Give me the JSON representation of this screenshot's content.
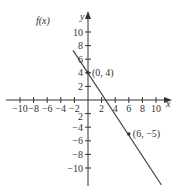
{
  "chart_data": {
    "type": "line",
    "title": "",
    "xlabel": "x",
    "ylabel": "y",
    "xlim": [
      -11,
      11
    ],
    "ylim": [
      -11,
      11
    ],
    "grid": false,
    "x_ticks": [
      -10,
      -8,
      -6,
      -4,
      -2,
      2,
      4,
      6,
      8,
      10
    ],
    "y_ticks": [
      -10,
      -8,
      -6,
      -4,
      -2,
      2,
      4,
      6,
      8,
      10
    ],
    "x_tick_labels": [
      "−10",
      "−8",
      "−6",
      "−4",
      "−2",
      "2",
      "4",
      "6",
      "8",
      "10"
    ],
    "y_tick_labels": [
      "−10",
      "−8",
      "−6",
      "−4",
      "−2",
      "2",
      "4",
      "6",
      "8",
      "10"
    ],
    "series": [
      {
        "name": "f(x)",
        "label": "f(x)",
        "x": [
          -2.2,
          10.8
        ],
        "y": [
          7.3,
          -12.5
        ]
      }
    ],
    "points": [
      {
        "x": 0,
        "y": 4,
        "label": "(0, 4)"
      },
      {
        "x": 6,
        "y": -5,
        "label": "(6, −5)"
      }
    ],
    "annotations": [
      "f(x)",
      "(0, 4)",
      "(6, −5)"
    ]
  },
  "labels": {
    "function": "f(x)",
    "x_axis": "x",
    "y_axis": "y",
    "point_a": "(0, 4)",
    "point_b": "(6, −5)"
  },
  "colors": {
    "axis": "#333333",
    "line": "#444444",
    "point": "#333333",
    "background": "#ffffff"
  }
}
